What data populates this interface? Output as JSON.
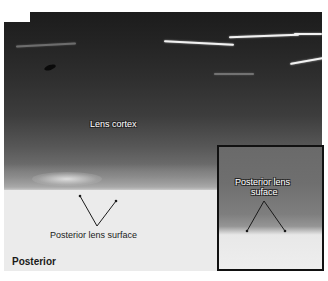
{
  "figure": {
    "panel_label": "C",
    "main_image": {
      "labels": {
        "lens_cortex": "Lens cortex",
        "posterior_lens_surface": "Posterior lens surface",
        "orientation": "Posterior"
      }
    },
    "inset": {
      "label_line1": "Posterior lens",
      "label_line2": "suface"
    },
    "colors": {
      "annotation_line": "#1a1a1a",
      "outlined_text": "#ffffff",
      "inset_border": "#111111"
    }
  }
}
